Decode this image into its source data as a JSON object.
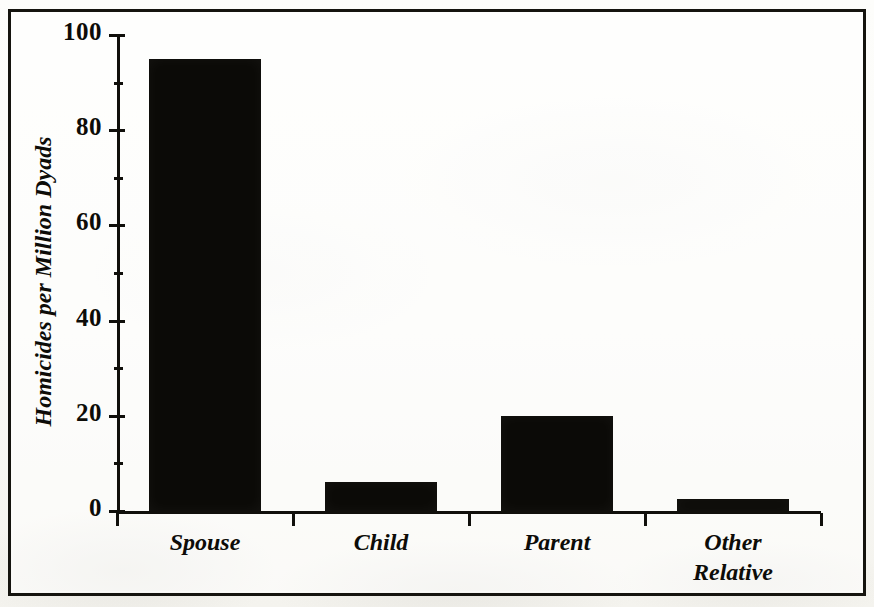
{
  "figure": {
    "frame_color": "#15140f",
    "background_color": "#fbfbf8",
    "bar_color": "#0b0a07"
  },
  "chart_data": {
    "type": "bar",
    "title": "",
    "subtitle": "",
    "xlabel": "",
    "ylabel": "Homicides per Million Dyads",
    "categories": [
      "Spouse",
      "Child",
      "Parent",
      "Other Relative"
    ],
    "category_lines": [
      [
        "Spouse"
      ],
      [
        "Child"
      ],
      [
        "Parent"
      ],
      [
        "Other",
        "Relative"
      ]
    ],
    "values": [
      95,
      6,
      20,
      2.5
    ],
    "ylim": [
      0,
      100
    ],
    "xlim": [
      0,
      4
    ],
    "y_major_ticks": [
      0,
      20,
      40,
      60,
      80,
      100
    ],
    "y_major_tick_labels": [
      "0",
      "20",
      "40",
      "60",
      "80",
      "100"
    ],
    "y_minor_ticks": [
      10,
      30,
      50,
      70,
      90
    ],
    "grid": false,
    "legend": null,
    "legend_position": "none",
    "annotations": []
  }
}
